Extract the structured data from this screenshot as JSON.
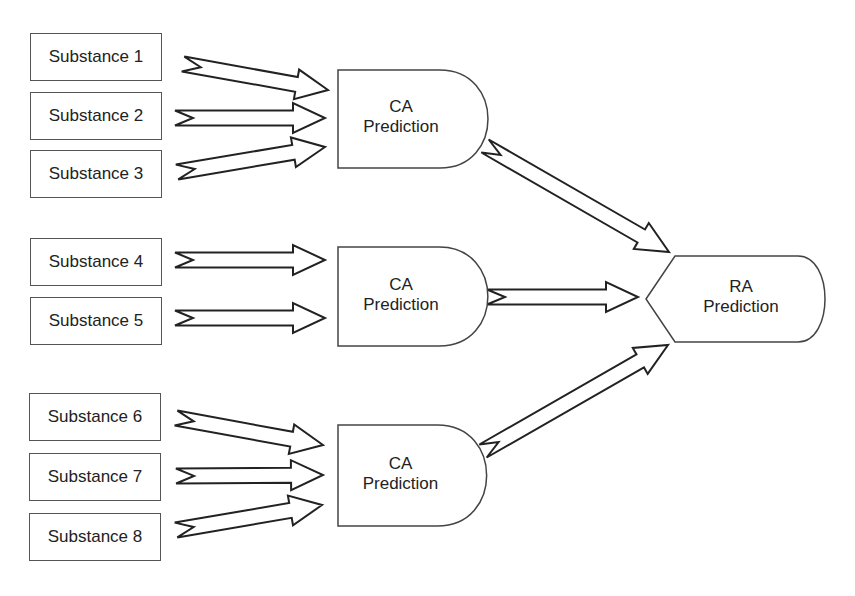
{
  "diagram": {
    "colors": {
      "stroke": "#222222",
      "box_border": "#555555",
      "shape_border": "#444444",
      "fill": "#ffffff",
      "text": "#222222"
    },
    "substances": [
      {
        "label": "Substance 1",
        "x": 30,
        "y": 33,
        "w": 132,
        "h": 48
      },
      {
        "label": "Substance 2",
        "x": 30,
        "y": 92,
        "w": 132,
        "h": 48
      },
      {
        "label": "Substance 3",
        "x": 30,
        "y": 150,
        "w": 132,
        "h": 48
      },
      {
        "label": "Substance 4",
        "x": 30,
        "y": 238,
        "w": 132,
        "h": 48
      },
      {
        "label": "Substance 5",
        "x": 30,
        "y": 297,
        "w": 132,
        "h": 48
      },
      {
        "label": "Substance 6",
        "x": 29,
        "y": 393,
        "w": 132,
        "h": 48
      },
      {
        "label": "Substance 7",
        "x": 29,
        "y": 453,
        "w": 132,
        "h": 48
      },
      {
        "label": "Substance 8",
        "x": 29,
        "y": 513,
        "w": 132,
        "h": 48
      }
    ],
    "ca_predictions": [
      {
        "line1": "CA",
        "line2": "Prediction",
        "x": 338,
        "y": 70,
        "w": 146,
        "h": 98
      },
      {
        "line1": "CA",
        "line2": "Prediction",
        "x": 338,
        "y": 247,
        "w": 146,
        "h": 99
      },
      {
        "line1": "CA",
        "line2": "Prediction",
        "x": 338,
        "y": 425,
        "w": 145,
        "h": 101
      }
    ],
    "ra_prediction": {
      "line1": "RA",
      "line2": "Prediction",
      "x": 646,
      "y": 256,
      "w": 180,
      "h": 86
    },
    "arrows": [
      {
        "from": "Substance 1",
        "to": "CA Prediction 1",
        "x1": 183,
        "y1": 64,
        "x2": 328,
        "y2": 90
      },
      {
        "from": "Substance 2",
        "to": "CA Prediction 1",
        "x1": 175,
        "y1": 118,
        "x2": 325,
        "y2": 118
      },
      {
        "from": "Substance 3",
        "to": "CA Prediction 1",
        "x1": 177,
        "y1": 172,
        "x2": 325,
        "y2": 147
      },
      {
        "from": "Substance 4",
        "to": "CA Prediction 2",
        "x1": 175,
        "y1": 260,
        "x2": 325,
        "y2": 260
      },
      {
        "from": "Substance 5",
        "to": "CA Prediction 2",
        "x1": 175,
        "y1": 318,
        "x2": 325,
        "y2": 318
      },
      {
        "from": "Substance 6",
        "to": "CA Prediction 3",
        "x1": 176,
        "y1": 418,
        "x2": 323,
        "y2": 445
      },
      {
        "from": "Substance 7",
        "to": "CA Prediction 3",
        "x1": 176,
        "y1": 476,
        "x2": 323,
        "y2": 475
      },
      {
        "from": "Substance 8",
        "to": "CA Prediction 3",
        "x1": 176,
        "y1": 530,
        "x2": 322,
        "y2": 505
      },
      {
        "from": "CA Prediction 1",
        "to": "RA Prediction",
        "x1": 485,
        "y1": 146,
        "x2": 669,
        "y2": 252
      },
      {
        "from": "CA Prediction 2",
        "to": "RA Prediction",
        "x1": 487,
        "y1": 297,
        "x2": 638,
        "y2": 297
      },
      {
        "from": "CA Prediction 3",
        "to": "RA Prediction",
        "x1": 483,
        "y1": 451,
        "x2": 668,
        "y2": 345
      }
    ],
    "arrow_style": {
      "shaft_half_width": 7.5,
      "head_half_width": 15,
      "head_length": 32,
      "notch_depth": 18
    }
  }
}
